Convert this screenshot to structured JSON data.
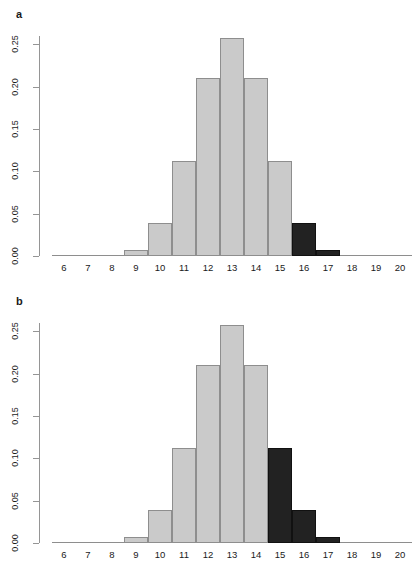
{
  "figure": {
    "background": "#ffffff",
    "width": 420,
    "height": 573
  },
  "colors": {
    "bar_light_fill": "#cacaca",
    "bar_light_border": "#8e8e8e",
    "bar_dark_fill": "#222222",
    "bar_dark_border": "#111111",
    "axis": "#959595",
    "text": "#1a1a1a"
  },
  "panels": [
    {
      "id": "a",
      "label": "a"
    },
    {
      "id": "b",
      "label": "b"
    }
  ],
  "axis": {
    "y_ticks": [
      "0.00",
      "0.05",
      "0.10",
      "0.15",
      "0.20",
      "0.25"
    ],
    "y_tick_values": [
      0.0,
      0.05,
      0.1,
      0.15,
      0.2,
      0.25
    ],
    "x_ticks": [
      "6",
      "7",
      "8",
      "9",
      "10",
      "11",
      "12",
      "13",
      "14",
      "15",
      "16",
      "17",
      "18",
      "19",
      "20"
    ]
  },
  "chart_data": [
    {
      "type": "bar",
      "panel": "a",
      "title": "a",
      "xlabel": "",
      "ylabel": "",
      "categories": [
        6,
        7,
        8,
        9,
        10,
        11,
        12,
        13,
        14,
        15,
        16,
        17,
        18,
        19,
        20
      ],
      "values": [
        0.0,
        0.0,
        0.001,
        0.007,
        0.039,
        0.112,
        0.21,
        0.258,
        0.21,
        0.112,
        0.039,
        0.007,
        0.001,
        0.0,
        0.0
      ],
      "bar_colors": [
        "light",
        "light",
        "light",
        "light",
        "light",
        "light",
        "light",
        "light",
        "light",
        "light",
        "dark",
        "dark",
        "dark",
        "dark",
        "dark"
      ],
      "highlight_region": "x >= 16",
      "ylim": [
        0,
        0.26
      ],
      "xlim": [
        5.5,
        20.5
      ],
      "grid": false,
      "legend": null
    },
    {
      "type": "bar",
      "panel": "b",
      "title": "b",
      "xlabel": "",
      "ylabel": "",
      "categories": [
        6,
        7,
        8,
        9,
        10,
        11,
        12,
        13,
        14,
        15,
        16,
        17,
        18,
        19,
        20
      ],
      "values": [
        0.0,
        0.0,
        0.001,
        0.007,
        0.039,
        0.112,
        0.21,
        0.258,
        0.21,
        0.112,
        0.039,
        0.007,
        0.001,
        0.0,
        0.0
      ],
      "bar_colors": [
        "light",
        "light",
        "light",
        "light",
        "light",
        "light",
        "light",
        "light",
        "light",
        "dark",
        "dark",
        "dark",
        "dark",
        "dark",
        "dark"
      ],
      "highlight_region": "x >= 15",
      "ylim": [
        0,
        0.26
      ],
      "xlim": [
        5.5,
        20.5
      ],
      "grid": false,
      "legend": null
    }
  ]
}
